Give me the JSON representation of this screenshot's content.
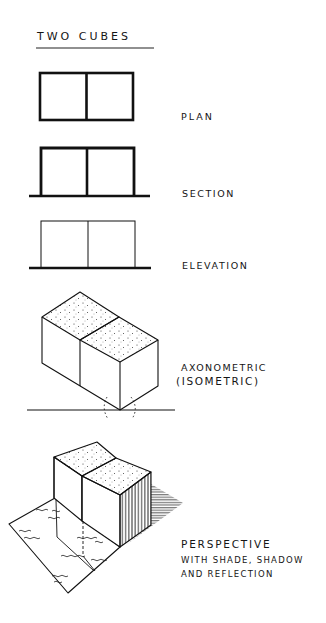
{
  "title": "TWO CUBES",
  "views": [
    {
      "id": "plan",
      "label": "PLAN"
    },
    {
      "id": "section",
      "label": "SECTION"
    },
    {
      "id": "elevation",
      "label": "ELEVATION"
    },
    {
      "id": "axonometric",
      "label": "AXONOMETRIC",
      "sublabel": "(ISOMETRIC)"
    },
    {
      "id": "perspective",
      "label": "PERSPECTIVE",
      "sublabel_1": "WITH SHADE, SHADOW",
      "sublabel_2": "AND REFLECTION"
    }
  ],
  "colors": {
    "ink": "#151515",
    "paper": "#ffffff"
  }
}
